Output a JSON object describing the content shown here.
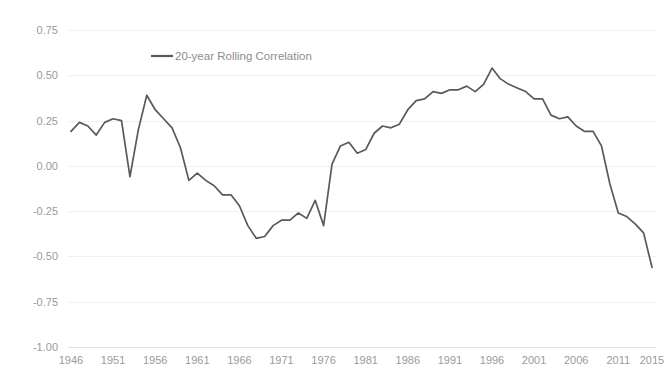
{
  "chart_data": {
    "type": "line",
    "title": "",
    "xlabel": "",
    "ylabel": "",
    "grid": true,
    "legend_position": "top-left",
    "xlim": [
      1946,
      2015
    ],
    "ylim": [
      -1.0,
      0.75
    ],
    "y_ticks": [
      0.75,
      0.5,
      0.25,
      0.0,
      -0.25,
      -0.5,
      -0.75,
      -1.0
    ],
    "y_tick_labels": [
      "0.75",
      "0.50",
      "0.25",
      "0.00",
      "-0.25",
      "-0.50",
      "-0.75",
      "-1.00"
    ],
    "x_ticks": [
      1946,
      1951,
      1956,
      1961,
      1966,
      1971,
      1976,
      1981,
      1986,
      1991,
      1996,
      2001,
      2006,
      2011,
      2015
    ],
    "x_tick_labels": [
      "1946",
      "1951",
      "1956",
      "1961",
      "1966",
      "1971",
      "1976",
      "1981",
      "1986",
      "1991",
      "1996",
      "2001",
      "2006",
      "2011",
      "2015"
    ],
    "series": [
      {
        "name": "20-year Rolling Correlation",
        "color": "#595959",
        "x": [
          1946,
          1947,
          1948,
          1949,
          1950,
          1951,
          1952,
          1953,
          1954,
          1955,
          1956,
          1957,
          1958,
          1959,
          1960,
          1961,
          1962,
          1963,
          1964,
          1965,
          1966,
          1967,
          1968,
          1969,
          1970,
          1971,
          1972,
          1973,
          1974,
          1975,
          1976,
          1977,
          1978,
          1979,
          1980,
          1981,
          1982,
          1983,
          1984,
          1985,
          1986,
          1987,
          1988,
          1989,
          1990,
          1991,
          1992,
          1993,
          1994,
          1995,
          1996,
          1997,
          1998,
          1999,
          2000,
          2001,
          2002,
          2003,
          2004,
          2005,
          2006,
          2007,
          2008,
          2009,
          2010,
          2011,
          2012,
          2013,
          2014,
          2015
        ],
        "values": [
          0.19,
          0.24,
          0.22,
          0.17,
          0.24,
          0.26,
          0.25,
          -0.06,
          0.2,
          0.39,
          0.31,
          0.26,
          0.21,
          0.1,
          -0.08,
          -0.04,
          -0.08,
          -0.11,
          -0.16,
          -0.16,
          -0.22,
          -0.33,
          -0.4,
          -0.39,
          -0.33,
          -0.3,
          -0.3,
          -0.26,
          -0.29,
          -0.19,
          -0.33,
          0.01,
          0.11,
          0.13,
          0.07,
          0.09,
          0.18,
          0.22,
          0.21,
          0.23,
          0.31,
          0.36,
          0.37,
          0.41,
          0.4,
          0.42,
          0.42,
          0.44,
          0.41,
          0.45,
          0.54,
          0.48,
          0.45,
          0.43,
          0.41,
          0.37,
          0.37,
          0.28,
          0.26,
          0.27,
          0.22,
          0.19,
          0.19,
          0.11,
          -0.1,
          -0.26,
          -0.28,
          -0.32,
          -0.37,
          -0.56
        ]
      }
    ]
  },
  "legend": {
    "items": [
      {
        "label": "20-year Rolling Correlation",
        "color": "#595959"
      }
    ]
  },
  "colors": {
    "line": "#595959",
    "gridline": "#f0f0f0",
    "axis": "#e2e2e2",
    "tick_text": "#9a9a9a",
    "legend_text": "#8d8d8d",
    "background": "#ffffff"
  }
}
